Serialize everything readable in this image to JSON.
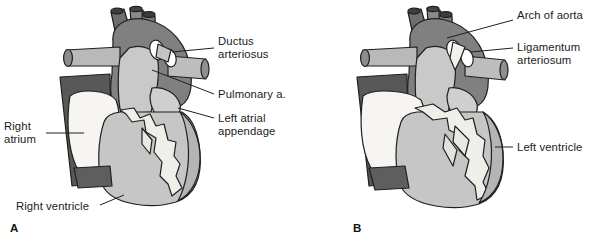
{
  "figure": {
    "panels": [
      {
        "letter": "A",
        "labels": [
          {
            "name": "ductus-arteriosus",
            "text": "Ductus\narteriosus"
          },
          {
            "name": "pulmonary-artery",
            "text": "Pulmonary a."
          },
          {
            "name": "left-atrial-appendage",
            "text": "Left atrial\nappendage"
          },
          {
            "name": "right-atrium",
            "text": "Right\natrium"
          },
          {
            "name": "right-ventricle",
            "text": "Right ventricle"
          }
        ]
      },
      {
        "letter": "B",
        "labels": [
          {
            "name": "arch-of-aorta",
            "text": "Arch of aorta"
          },
          {
            "name": "ligamentum-arteriosum",
            "text": "Ligamentum\narteriosum"
          },
          {
            "name": "left-ventricle",
            "text": "Left ventricle"
          }
        ]
      }
    ]
  },
  "colors": {
    "aorta_dark": "#808080",
    "vessel_darker": "#585858",
    "vessel_light": "#b9b9b9",
    "ventricle_gray": "#c6c6c6",
    "atrium_white": "#f6f5f2",
    "fat_white": "#efeee9",
    "outline": "#1f1f1f",
    "leader": "#1f1f1f",
    "background": "#ffffff",
    "text": "#1b1b1b"
  }
}
